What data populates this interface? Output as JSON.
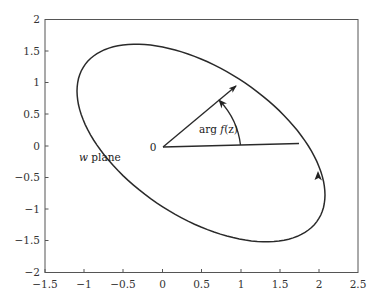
{
  "chart_data": {
    "type": "line",
    "title": "",
    "xlabel": "",
    "ylabel": "",
    "xlim": [
      -1.5,
      2.5
    ],
    "ylim": [
      -2,
      2
    ],
    "grid": false,
    "legend": null,
    "x_ticks": [
      "-1.5",
      "-1",
      "-0.5",
      "0",
      "0.5",
      "1",
      "1.5",
      "2",
      "2.5"
    ],
    "y_ticks": [
      "2",
      "1.5",
      "1",
      "0.5",
      "0",
      "-0.5",
      "-1",
      "-1.5",
      "-2"
    ],
    "series": [
      {
        "name": "image contour (ellipse)",
        "shape": "rotated ellipse",
        "center": [
          0.5,
          0.0
        ],
        "approx_points": [
          [
            -1.05,
            0.93
          ],
          [
            -0.5,
            1.6
          ],
          [
            0.95,
            0.98
          ],
          [
            1.75,
            0.05
          ],
          [
            2.08,
            -0.75
          ],
          [
            1.5,
            -1.6
          ],
          [
            0.5,
            -0.85
          ],
          [
            -0.75,
            0.4
          ]
        ],
        "extremes": {
          "leftmost": [
            -1.07,
            0.87
          ],
          "top": [
            -0.47,
            1.6
          ],
          "rightmost": [
            2.09,
            -0.84
          ],
          "bottom": [
            1.47,
            -1.55
          ]
        },
        "direction": "counterclockwise"
      },
      {
        "name": "ray to upper point",
        "from": [
          0,
          0
        ],
        "to": [
          0.95,
          0.98
        ],
        "arrow": true
      },
      {
        "name": "ray to right point",
        "from": [
          0,
          0
        ],
        "to": [
          1.75,
          0.05
        ],
        "arrow": false
      }
    ],
    "annotations": [
      {
        "text": "0",
        "at": [
          -0.08,
          0.0
        ]
      },
      {
        "text": "arg f(z)",
        "at": [
          0.6,
          0.28
        ],
        "note": "angle arc with arrow between the two rays"
      },
      {
        "text": "w plane",
        "at": [
          -1.0,
          -0.2
        ]
      }
    ]
  },
  "labels": {
    "origin": "0",
    "arg_prefix": "arg ",
    "arg_func": "f",
    "arg_paren": "(z)",
    "plane_w": "w",
    "plane_word": " plane"
  },
  "axes": {
    "x_ticks": [
      "−1.5",
      "−1",
      "−0.5",
      "0",
      "0.5",
      "1",
      "1.5",
      "2",
      "2.5"
    ],
    "y_ticks": [
      "2",
      "1.5",
      "1",
      "0.5",
      "0",
      "−0.5",
      "−1",
      "−1.5",
      "−2"
    ]
  },
  "colors": {
    "axis": "#555555",
    "curve": "#2a2a2a",
    "text": "#333333"
  }
}
